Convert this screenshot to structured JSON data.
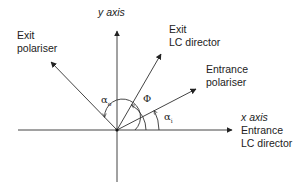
{
  "labels": {
    "y_axis": "y axis",
    "exit_polariser": [
      "Exit",
      "polariser"
    ],
    "exit_lc_director": [
      "Exit",
      "LC director"
    ],
    "entrance_polariser": [
      "Entrance",
      "polariser"
    ],
    "x_axis": [
      "x axis",
      "Entrance",
      "LC director"
    ]
  },
  "angles": {
    "alpha_o": {
      "symbol": "α",
      "sub": "o"
    },
    "phi": {
      "symbol": "Φ"
    },
    "alpha_i": {
      "symbol": "α",
      "sub": "i"
    }
  },
  "colors": {
    "line": "#333333",
    "text": "#222222"
  }
}
